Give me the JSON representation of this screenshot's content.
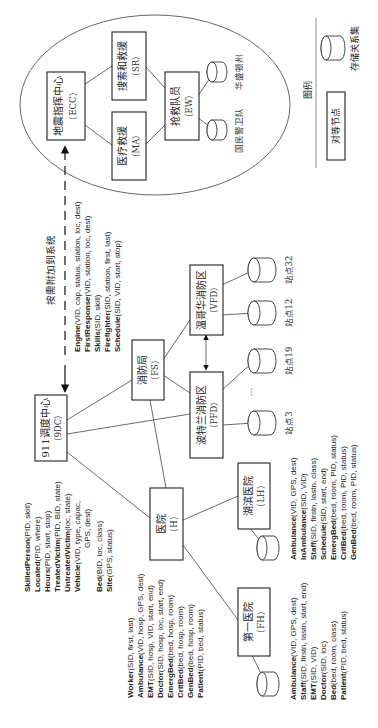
{
  "diagram": {
    "orientation": "rotated -90deg (text reads bottom-to-top)",
    "nodes": {
      "ecc": {
        "name": "地震指挥中心",
        "code": "（ECC）"
      },
      "sr": {
        "name": "搜索和救援",
        "code": "（SR）"
      },
      "ma": {
        "name": "医疗救援",
        "code": "（MA）"
      },
      "ew": {
        "name": "抢救队员",
        "code": "（EW）"
      },
      "dc": {
        "name": "911调度中心",
        "code": "（9DC）"
      },
      "fs": {
        "name": "消防局",
        "code": "（FS）"
      },
      "pfd": {
        "name": "波特兰消防区",
        "code": "（PFD）"
      },
      "vfd": {
        "name": "温哥华消防区",
        "code": "（VFD）"
      },
      "h": {
        "name": "医院",
        "code": "（H）"
      },
      "lh": {
        "name": "湖滨医院",
        "code": "（LH）"
      },
      "fh": {
        "name": "第一医院",
        "code": "（FH）"
      }
    },
    "stores": {
      "wa": "华盛顿州",
      "ng": "国民警卫队",
      "s32": "站点32",
      "s12": "站点12",
      "s19": "站点19",
      "s3": "站点3",
      "ellipsis": "…"
    },
    "dashed_link_label": "按需附加到系统",
    "legend": {
      "title": "图例",
      "peer_node": "对等节点",
      "relation_store": "存储关系集"
    },
    "schemas": {
      "dc": [
        {
          "name": "SkilledPerson",
          "attrs": "(PID, skill)"
        },
        {
          "name": "Located",
          "attrs": "(PID, where)"
        },
        {
          "name": "Hours",
          "attrs": "(PID, start, stop)"
        },
        {
          "name": "TreatedVictim",
          "attrs": "(PID, BID, state)"
        },
        {
          "name": "UntreatedVictim",
          "attrs": "(loc, state)"
        },
        {
          "name": "Vehicle",
          "attrs": "(VID, type, capac,"
        },
        {
          "name": "",
          "attrs": "GPS, dest)"
        },
        {
          "name": "Bed",
          "attrs": "(BID, loc, class)"
        },
        {
          "name": "Site",
          "attrs": "(GPS, status)"
        }
      ],
      "fs": [
        {
          "name": "Engine",
          "attrs": "(VID, cap, status, station, loc, dest)"
        },
        {
          "name": "FirstResponse",
          "attrs": "(VID, station, loc, dest)"
        },
        {
          "name": "Skills",
          "attrs": "(SID, skill)"
        },
        {
          "name": "Firefighter",
          "attrs": "(SID, station, first, last)"
        },
        {
          "name": "Schedule",
          "attrs": "(SID, VID, start, stop)"
        }
      ],
      "h": [
        {
          "name": "Worker",
          "attrs": "(SID, first, last)"
        },
        {
          "name": "Ambulance",
          "attrs": "(VID, hosp, GPS, dest)"
        },
        {
          "name": "EMT",
          "attrs": "(SID, hosp, VID, start, end)"
        },
        {
          "name": "Doctor",
          "attrs": "(SID, hosp, loc, start, end)"
        },
        {
          "name": "EmergBed",
          "attrs": "(bed, hosp, room)"
        },
        {
          "name": "CritBed",
          "attrs": "(bed, hosp, room)"
        },
        {
          "name": "GenBed",
          "attrs": "(bed, hosp, room)"
        },
        {
          "name": "Patient",
          "attrs": "(PID, bed, status)"
        }
      ],
      "lh": [
        {
          "name": "Ambulance",
          "attrs": "(VID, GPS, dest)"
        },
        {
          "name": "InAmbulance",
          "attrs": "(SID, VID)"
        },
        {
          "name": "Staff",
          "attrs": "(SID, firstn, lastn, class)"
        },
        {
          "name": "Schedule",
          "attrs": "(SID, start, end)"
        },
        {
          "name": "EmergBed",
          "attrs": "(bed, room, PID, status)"
        },
        {
          "name": "CritBed",
          "attrs": "(bed, room, PID, status)"
        },
        {
          "name": "GenBed",
          "attrs": "(bed, room, PID, status)"
        }
      ],
      "fh": [
        {
          "name": "Ambulance",
          "attrs": "(VID, GPS, dest)"
        },
        {
          "name": "Staff",
          "attrs": "(SID, firstn, lastn, start, end)"
        },
        {
          "name": "EMT",
          "attrs": "(SID, VID)"
        },
        {
          "name": "Doctor",
          "attrs": "(SID, loc)"
        },
        {
          "name": "Bed",
          "attrs": "(bed, room, class)"
        },
        {
          "name": "Patient",
          "attrs": "(PID, bed, status)"
        }
      ]
    }
  }
}
